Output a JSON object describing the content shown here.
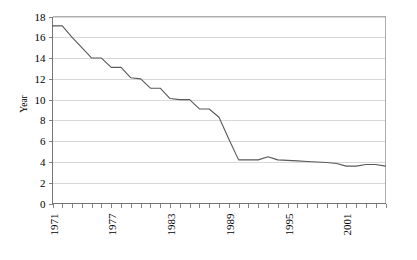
{
  "chart_data": {
    "type": "line",
    "title": "",
    "xlabel": "",
    "ylabel": "Year",
    "ylim": [
      0,
      18
    ],
    "ytick_labels": [
      "0",
      "2",
      "4",
      "6",
      "8",
      "10",
      "12",
      "14",
      "16",
      "18"
    ],
    "ytick_values": [
      0,
      2,
      4,
      6,
      8,
      10,
      12,
      14,
      16,
      18
    ],
    "xlim": [
      1971,
      2005
    ],
    "xtick_labels": [
      "1971",
      "1977",
      "1983",
      "1989",
      "1995",
      "2001"
    ],
    "xtick_values": [
      1971,
      1977,
      1983,
      1989,
      1995,
      2001
    ],
    "xtick_rotation": 90,
    "grid": "horizontal",
    "legend": "none",
    "x": [
      1971,
      1972,
      1973,
      1974,
      1975,
      1976,
      1977,
      1978,
      1979,
      1980,
      1981,
      1982,
      1983,
      1984,
      1985,
      1986,
      1987,
      1988,
      1989,
      1990,
      1991,
      1992,
      1993,
      1994,
      1995,
      1996,
      1997,
      1998,
      1999,
      2000,
      2001,
      2002,
      2003,
      2004,
      2005
    ],
    "values": [
      17.1,
      17.1,
      16.0,
      15.0,
      14.0,
      14.0,
      13.1,
      13.1,
      12.1,
      12.0,
      11.1,
      11.1,
      10.1,
      10.0,
      10.0,
      9.1,
      9.1,
      8.3,
      6.2,
      4.2,
      4.2,
      4.2,
      4.5,
      4.2,
      4.15,
      4.1,
      4.05,
      4.0,
      3.95,
      3.85,
      3.6,
      3.6,
      3.75,
      3.75,
      3.6
    ],
    "series": [
      {
        "name": "series-1",
        "color": "#595959",
        "values": [
          17.1,
          17.1,
          16.0,
          15.0,
          14.0,
          14.0,
          13.1,
          13.1,
          12.1,
          12.0,
          11.1,
          11.1,
          10.1,
          10.0,
          10.0,
          9.1,
          9.1,
          8.3,
          6.2,
          4.2,
          4.2,
          4.2,
          4.5,
          4.2,
          4.15,
          4.1,
          4.05,
          4.0,
          3.95,
          3.85,
          3.6,
          3.6,
          3.75,
          3.75,
          3.6
        ]
      }
    ],
    "colors": {
      "line": "#595959",
      "grid": "#c8c8c8",
      "axis": "#666666",
      "border": "#9a9a9a",
      "background": "#ffffff"
    }
  }
}
